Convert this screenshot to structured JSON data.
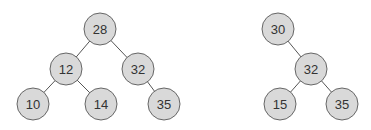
{
  "trees": [
    {
      "name": "left-tree",
      "nodes": [
        {
          "id": "n28",
          "label": "28",
          "x": 100,
          "y": 29
        },
        {
          "id": "n12",
          "label": "12",
          "x": 66,
          "y": 69
        },
        {
          "id": "n32",
          "label": "32",
          "x": 138,
          "y": 69
        },
        {
          "id": "n10",
          "label": "10",
          "x": 33,
          "y": 104
        },
        {
          "id": "n14",
          "label": "14",
          "x": 101,
          "y": 104
        },
        {
          "id": "n35",
          "label": "35",
          "x": 164,
          "y": 104
        }
      ],
      "edges": [
        [
          "n28",
          "n12"
        ],
        [
          "n28",
          "n32"
        ],
        [
          "n12",
          "n10"
        ],
        [
          "n12",
          "n14"
        ],
        [
          "n32",
          "n35"
        ]
      ]
    },
    {
      "name": "right-tree",
      "nodes": [
        {
          "id": "m30",
          "label": "30",
          "x": 278,
          "y": 29
        },
        {
          "id": "m32",
          "label": "32",
          "x": 311,
          "y": 69
        },
        {
          "id": "m15",
          "label": "15",
          "x": 280,
          "y": 104
        },
        {
          "id": "m35",
          "label": "35",
          "x": 342,
          "y": 104
        }
      ],
      "edges": [
        [
          "m30",
          "m32"
        ],
        [
          "m32",
          "m15"
        ],
        [
          "m32",
          "m35"
        ]
      ]
    }
  ],
  "style": {
    "node_fill": "#d9d9d9",
    "node_stroke": "#666666",
    "edge_color": "#555555",
    "radius": 16
  }
}
